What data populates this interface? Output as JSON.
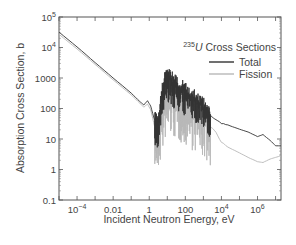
{
  "chart_data": {
    "type": "line",
    "title_parts": {
      "superscript": "235",
      "element": "U",
      "rest": " Cross Sections"
    },
    "xlabel": "Incident Neutron Energy, eV",
    "ylabel": "Absorption Cross Section, b",
    "xscale": "log",
    "yscale": "log",
    "xlim": [
      1e-05,
      20000000.0
    ],
    "ylim": [
      0.1,
      100000
    ],
    "x_ticks": [
      {
        "value": 0.0001,
        "label": "10",
        "sup": "−4"
      },
      {
        "value": 0.01,
        "label": "0.01",
        "sup": ""
      },
      {
        "value": 1,
        "label": "1",
        "sup": ""
      },
      {
        "value": 100,
        "label": "100",
        "sup": ""
      },
      {
        "value": 10000,
        "label": "10",
        "sup": "4"
      },
      {
        "value": 1000000,
        "label": "10",
        "sup": "6"
      }
    ],
    "y_ticks": [
      {
        "value": 0.1,
        "label": "0.1",
        "sup": ""
      },
      {
        "value": 1,
        "label": "1",
        "sup": ""
      },
      {
        "value": 10,
        "label": "10",
        "sup": ""
      },
      {
        "value": 100,
        "label": "100",
        "sup": ""
      },
      {
        "value": 1000,
        "label": "1000",
        "sup": ""
      },
      {
        "value": 10000,
        "label": "10",
        "sup": "4"
      },
      {
        "value": 100000,
        "label": "10",
        "sup": "5"
      }
    ],
    "grid": false,
    "legend_position": "upper right",
    "series": [
      {
        "name": "Total",
        "color": "#333333",
        "x": [
          1e-05,
          0.0001,
          0.001,
          0.01,
          0.1,
          0.3,
          0.5,
          0.8,
          1.2,
          2,
          3,
          5,
          8,
          12,
          20,
          35,
          60,
          100,
          200,
          400,
          800,
          1500,
          2500,
          4000,
          10000,
          30000,
          100000,
          300000,
          1000000,
          2000000,
          5000000,
          10000000,
          20000000
        ],
        "y": [
          32000,
          10500,
          3200,
          1000,
          320,
          170,
          130,
          180,
          120,
          40,
          25,
          300,
          900,
          1000,
          700,
          500,
          420,
          360,
          250,
          180,
          120,
          80,
          60,
          45,
          33,
          27,
          21,
          17,
          12,
          14,
          9,
          6,
          6
        ]
      },
      {
        "name": "Fission",
        "color": "#b8b8b8",
        "x": [
          1e-05,
          0.0001,
          0.001,
          0.01,
          0.1,
          0.3,
          0.5,
          0.8,
          1.2,
          2,
          3,
          5,
          8,
          12,
          20,
          35,
          60,
          100,
          200,
          400,
          800,
          1500,
          2500,
          4000,
          10000,
          30000,
          100000,
          300000,
          1000000,
          2000000,
          5000000,
          10000000,
          20000000
        ],
        "y": [
          27000,
          9000,
          2800,
          870,
          280,
          150,
          110,
          140,
          90,
          25,
          12,
          60,
          200,
          300,
          220,
          160,
          140,
          120,
          90,
          70,
          50,
          35,
          25,
          20,
          8,
          5,
          3.5,
          2.5,
          1.8,
          1.7,
          2.2,
          2.5,
          2.8
        ]
      }
    ],
    "annotations": [
      "Dense resonance region between ~1 eV and ~2.5 keV"
    ]
  }
}
